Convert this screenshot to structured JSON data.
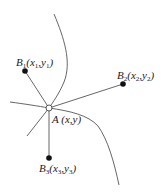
{
  "diagram": {
    "colors": {
      "stroke": "#555555",
      "point_fill": "#111111",
      "background": "#ffffff"
    },
    "center_point": {
      "name": "A",
      "coords": "(x,y)",
      "x": 49,
      "y": 108
    },
    "points": [
      {
        "name": "B",
        "sub": "1",
        "x_label": "x",
        "x_sub": "1",
        "y_label": "y",
        "y_sub": "1",
        "x": 25,
        "y": 71
      },
      {
        "name": "B",
        "sub": "2",
        "x_label": "x",
        "x_sub": "2",
        "y_label": "y",
        "y_sub": "2",
        "x": 123,
        "y": 84
      },
      {
        "name": "B",
        "sub": "3",
        "x_label": "x",
        "x_sub": "3",
        "y_label": "y",
        "y_sub": "3",
        "x": 49,
        "y": 158
      }
    ],
    "labels": {
      "A": "A (x,y)",
      "B1_name": "B",
      "B1_sub": "1",
      "B1_x": "x",
      "B1_x_sub": "1",
      "B1_y": "y",
      "B1_y_sub": "1",
      "B2_name": "B",
      "B2_sub": "2",
      "B2_x": "x",
      "B2_x_sub": "2",
      "B2_y": "y",
      "B2_y_sub": "2",
      "B3_name": "B",
      "B3_sub": "3",
      "B3_x": "x",
      "B3_x_sub": "3",
      "B3_y": "y",
      "B3_y_sub": "3"
    }
  }
}
